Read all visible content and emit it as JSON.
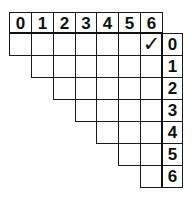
{
  "header": {
    "columns": [
      "0",
      "1",
      "2",
      "3",
      "4",
      "5",
      "6"
    ]
  },
  "row_labels": [
    "0",
    "1",
    "2",
    "3",
    "4",
    "5",
    "6"
  ],
  "grid": {
    "shape": "upper-triangular staircase",
    "rows": [
      {
        "row": "0",
        "cells_from_col": "0"
      },
      {
        "row": "1",
        "cells_from_col": "1"
      },
      {
        "row": "2",
        "cells_from_col": "2"
      },
      {
        "row": "3",
        "cells_from_col": "3"
      },
      {
        "row": "4",
        "cells_from_col": "4"
      },
      {
        "row": "5",
        "cells_from_col": "5"
      },
      {
        "row": "6",
        "cells_from_col": "6"
      }
    ],
    "marks": [
      {
        "row": "0",
        "col": "6",
        "glyph": "✓",
        "icon": "checkmark-icon"
      }
    ]
  },
  "colors": {
    "line": "#1a1a1a",
    "background": "#ffffff",
    "text": "#111111"
  }
}
